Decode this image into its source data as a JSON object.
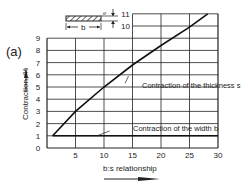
{
  "panel_label": "(a)",
  "chart_data": {
    "type": "line",
    "title": "",
    "xlabel": "b:s relationship",
    "ylabel": "Contraction, %",
    "xlim": [
      0,
      30
    ],
    "ylim": [
      0,
      11
    ],
    "grid": true,
    "x_ticks": [
      5,
      10,
      15,
      20,
      25,
      30
    ],
    "y_ticks": [
      0,
      1,
      2,
      3,
      4,
      5,
      6,
      7,
      8,
      9,
      10,
      11
    ],
    "series": [
      {
        "name": "Contraction of the thickness s",
        "x": [
          1,
          5,
          10,
          15,
          20,
          25,
          28.2
        ],
        "y": [
          1,
          3,
          5,
          6.8,
          8.4,
          9.9,
          11
        ]
      },
      {
        "name": "Contraction of the width b",
        "x": [
          1,
          30
        ],
        "y": [
          1,
          1
        ]
      }
    ],
    "annotations": [
      {
        "text": "Contraction of the thickness s",
        "x": 14,
        "y": 6
      },
      {
        "text": "Contraction of the width b",
        "x": 11,
        "y": 1.2
      }
    ]
  },
  "schematic": {
    "b_label": "b",
    "s_label": "s"
  }
}
